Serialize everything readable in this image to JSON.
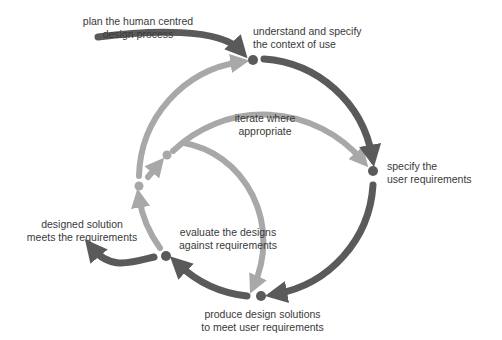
{
  "diagram": {
    "title": "Human centred design process",
    "colors": {
      "dark": "#5a5a5a",
      "light": "#a8a8a8",
      "text": "#3a3a3a",
      "background": "#ffffff"
    },
    "labels": {
      "plan": {
        "line1": "plan the human centred",
        "line2": "design process"
      },
      "context": {
        "line1": "understand and specify",
        "line2": "the context of use"
      },
      "requirements": {
        "line1": "specify the",
        "line2": "user requirements"
      },
      "iterate": {
        "line1": "iterate where",
        "line2": "appropriate"
      },
      "evaluate": {
        "line1": "evaluate the designs",
        "line2": "against requirements"
      },
      "produce": {
        "line1": "produce design solutions",
        "line2": "to meet user requirements"
      },
      "solution": {
        "line1": "designed solution",
        "line2": "meets the requirements"
      }
    },
    "nodes": [
      {
        "id": "context",
        "shade": "dark"
      },
      {
        "id": "requirements",
        "shade": "dark"
      },
      {
        "id": "produce",
        "shade": "dark"
      },
      {
        "id": "evaluate",
        "shade": "dark"
      },
      {
        "id": "iterate-outer",
        "shade": "light"
      },
      {
        "id": "iterate-inner",
        "shade": "light"
      }
    ]
  }
}
